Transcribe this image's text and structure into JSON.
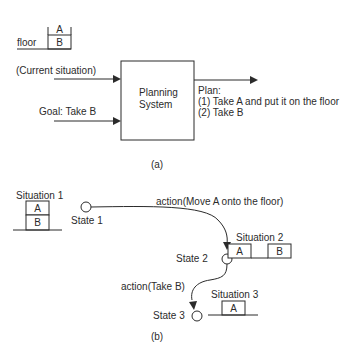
{
  "part_a": {
    "floor_label": "floor",
    "block_top": "A",
    "block_bottom": "B",
    "input1": "(Current situation)",
    "input2": "Goal: Take B",
    "system_line1": "Planning",
    "system_line2": "System",
    "plan_title": "Plan:",
    "plan_step1": "(1) Take A and put it on the floor",
    "plan_step2": "(2) Take B",
    "caption": "(a)"
  },
  "part_b": {
    "situation1": {
      "label": "Situation 1",
      "block_top": "A",
      "block_bottom": "B"
    },
    "state1": "State 1",
    "action1": "action(Move A onto the floor)",
    "situation2": {
      "label": "Situation 2",
      "block_left": "A",
      "block_right": "B"
    },
    "state2": "State 2",
    "action2": "action(Take B)",
    "situation3": {
      "label": "Situation 3",
      "block": "A"
    },
    "state3": "State 3",
    "caption": "(b)"
  }
}
